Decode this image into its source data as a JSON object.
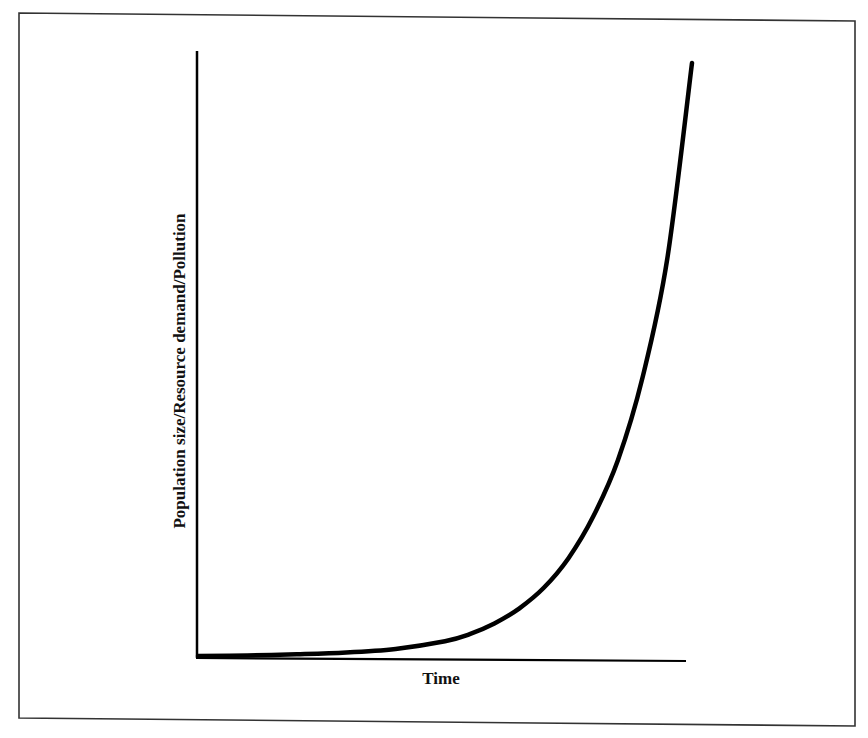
{
  "chart_data": {
    "type": "line",
    "title": "",
    "xlabel": "Time",
    "ylabel": "Population size/Resource demand/Pollution",
    "xticks": [],
    "yticks": [],
    "grid": false,
    "legend": null,
    "series": [
      {
        "name": "Population size/Resource demand/Pollution",
        "x": [
          0,
          0.1,
          0.2,
          0.3,
          0.4,
          0.5,
          0.55,
          0.6,
          0.65,
          0.7,
          0.75,
          0.8,
          0.85,
          0.9,
          0.95,
          1.0
        ],
        "y": [
          0,
          0.001,
          0.003,
          0.006,
          0.012,
          0.025,
          0.037,
          0.055,
          0.08,
          0.115,
          0.165,
          0.235,
          0.33,
          0.47,
          0.67,
          1.0
        ]
      }
    ],
    "xlim": [
      0,
      1
    ],
    "ylim": [
      0,
      1
    ],
    "colors": {
      "line": "#000000",
      "axes": "#000000",
      "frame": "#333333",
      "background": "#ffffff"
    }
  }
}
